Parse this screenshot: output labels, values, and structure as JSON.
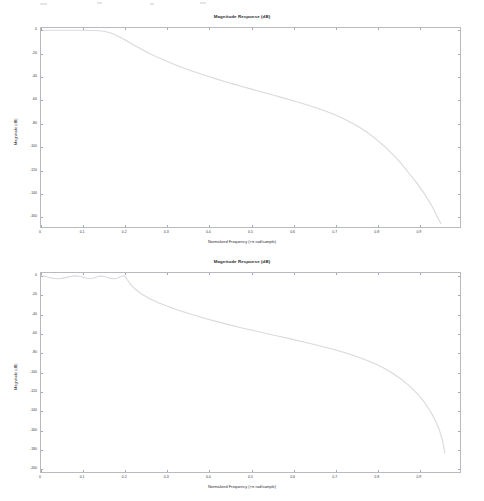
{
  "document": {
    "kind": "filter-magnitude-response-figures",
    "figure_count": 2
  },
  "figures": [
    {
      "id": "figure-1",
      "title": "Magnitude Response (dB)",
      "xlabel": "Normalized Frequency (×π rad/sample)",
      "ylabel": "Magnitude (dB)",
      "xticklabels": [
        "0",
        "0.1",
        "0.2",
        "0.3",
        "0.4",
        "0.5",
        "0.6",
        "0.7",
        "0.8",
        "0.9"
      ],
      "yticklabels": [
        "0",
        "-20",
        "-40",
        "-60",
        "-80",
        "-100",
        "-120",
        "-140",
        "-160"
      ]
    },
    {
      "id": "figure-2",
      "title": "Magnitude Response (dB)",
      "xlabel": "Normalized Frequency (×π rad/sample)",
      "ylabel": "Magnitude (dB)",
      "xticklabels": [
        "0",
        "0.1",
        "0.2",
        "0.3",
        "0.4",
        "0.5",
        "0.6",
        "0.7",
        "0.8",
        "0.9"
      ],
      "yticklabels": [
        "0",
        "-20",
        "-40",
        "-60",
        "-80",
        "-100",
        "-120",
        "-140",
        "-160",
        "-180",
        "-200"
      ]
    }
  ],
  "chart_data": [
    {
      "type": "line",
      "title": "Magnitude Response (dB)",
      "xlabel": "Normalized Frequency (×π rad/sample)",
      "ylabel": "Magnitude (dB)",
      "xlim": [
        0,
        1
      ],
      "ylim": [
        -170,
        2
      ],
      "xticks": [
        0,
        0.1,
        0.2,
        0.3,
        0.4,
        0.5,
        0.6,
        0.7,
        0.8,
        0.9
      ],
      "yticks": [
        0,
        -20,
        -40,
        -60,
        -80,
        -100,
        -120,
        -140,
        -160
      ],
      "grid": false,
      "legend": null,
      "series": [
        {
          "name": "Magnitude",
          "color": "#d9d9de",
          "x": [
            0.0,
            0.02,
            0.04,
            0.06,
            0.08,
            0.1,
            0.12,
            0.14,
            0.15,
            0.16,
            0.17,
            0.18,
            0.19,
            0.2,
            0.22,
            0.24,
            0.26,
            0.28,
            0.3,
            0.32,
            0.34,
            0.36,
            0.38,
            0.4,
            0.42,
            0.44,
            0.46,
            0.48,
            0.5,
            0.52,
            0.54,
            0.56,
            0.58,
            0.6,
            0.62,
            0.64,
            0.66,
            0.68,
            0.7,
            0.72,
            0.74,
            0.76,
            0.78,
            0.8,
            0.82,
            0.84,
            0.86,
            0.88,
            0.895,
            0.91,
            0.92,
            0.93,
            0.94,
            0.948,
            0.954
          ],
          "y": [
            0.0,
            0.0,
            0.0,
            0.0,
            0.0,
            0.0,
            -0.1,
            -0.4,
            -0.8,
            -1.6,
            -2.8,
            -4.4,
            -6.2,
            -8.2,
            -12.4,
            -16.4,
            -20.2,
            -23.6,
            -26.8,
            -29.8,
            -32.6,
            -35.2,
            -37.6,
            -40.0,
            -42.2,
            -44.4,
            -46.5,
            -48.6,
            -50.6,
            -52.6,
            -54.6,
            -56.6,
            -58.6,
            -60.6,
            -62.8,
            -65.0,
            -67.4,
            -70.0,
            -72.8,
            -76.0,
            -79.6,
            -83.8,
            -88.6,
            -94.2,
            -100.4,
            -107.4,
            -115.2,
            -124.4,
            -131.0,
            -138.6,
            -144.0,
            -150.0,
            -156.8,
            -162.6,
            -167.0
          ]
        }
      ]
    },
    {
      "type": "line",
      "title": "Magnitude Response (dB)",
      "xlabel": "Normalized Frequency (×π rad/sample)",
      "ylabel": "Magnitude (dB)",
      "xlim": [
        0,
        1
      ],
      "ylim": [
        -205,
        3
      ],
      "xticks": [
        0,
        0.1,
        0.2,
        0.3,
        0.4,
        0.5,
        0.6,
        0.7,
        0.8,
        0.9
      ],
      "yticks": [
        0,
        -20,
        -40,
        -60,
        -80,
        -100,
        -120,
        -140,
        -160,
        -180,
        -200
      ],
      "grid": false,
      "legend": null,
      "series": [
        {
          "name": "Magnitude",
          "color": "#d9d9de",
          "x": [
            0.0,
            0.01,
            0.02,
            0.03,
            0.04,
            0.05,
            0.06,
            0.07,
            0.08,
            0.09,
            0.1,
            0.11,
            0.118,
            0.126,
            0.134,
            0.142,
            0.15,
            0.158,
            0.166,
            0.174,
            0.182,
            0.188,
            0.192,
            0.196,
            0.2,
            0.206,
            0.214,
            0.224,
            0.24,
            0.26,
            0.28,
            0.3,
            0.33,
            0.36,
            0.39,
            0.42,
            0.45,
            0.48,
            0.51,
            0.54,
            0.57,
            0.6,
            0.63,
            0.66,
            0.69,
            0.72,
            0.75,
            0.78,
            0.8,
            0.82,
            0.84,
            0.86,
            0.88,
            0.9,
            0.915,
            0.93,
            0.94,
            0.95,
            0.958,
            0.964
          ],
          "y": [
            0.0,
            -0.6,
            -1.6,
            -2.6,
            -3.0,
            -2.6,
            -1.6,
            -0.6,
            0.0,
            -0.4,
            -1.4,
            -2.4,
            -2.8,
            -2.2,
            -1.0,
            -0.1,
            -0.5,
            -1.6,
            -2.6,
            -3.0,
            -2.4,
            -1.2,
            -0.4,
            -0.1,
            0.0,
            -4.0,
            -9.0,
            -13.5,
            -19.0,
            -24.0,
            -28.2,
            -31.6,
            -36.2,
            -40.4,
            -44.2,
            -47.8,
            -51.2,
            -54.4,
            -57.4,
            -60.4,
            -63.4,
            -66.4,
            -69.4,
            -72.6,
            -76.0,
            -79.6,
            -83.8,
            -88.6,
            -92.4,
            -96.8,
            -102.0,
            -108.0,
            -115.2,
            -124.0,
            -132.0,
            -142.0,
            -150.0,
            -160.0,
            -172.0,
            -185.0
          ]
        }
      ]
    }
  ]
}
